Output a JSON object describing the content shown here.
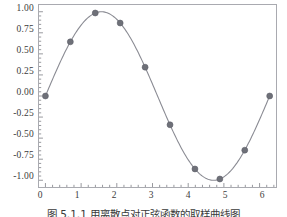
{
  "figure": {
    "caption": "图 5.1.1 用离散点对正弦函数的取样曲线图"
  },
  "axes": {
    "y_ticks": [
      "1.00",
      "0.75",
      "0.50",
      "0.25",
      "0.00",
      "-0.25",
      "-0.50",
      "-0.75",
      "-1.00"
    ],
    "x_ticks": [
      "0",
      "1",
      "2",
      "3",
      "4",
      "5",
      "6"
    ],
    "frame_color": "#a9aab0",
    "tick_color": "#8b8c92"
  },
  "style": {
    "line_color": "#8a8b93",
    "marker_color": "#6e7078",
    "marker_edge_color": "#5d5f68",
    "background": "#ffffff"
  },
  "chart_data": {
    "type": "line",
    "title": "",
    "xlabel": "",
    "ylabel": "",
    "xlim": [
      -0.18,
      6.46
    ],
    "ylim": [
      -1.08,
      1.08
    ],
    "grid": false,
    "legend": null,
    "markers": true,
    "series": [
      {
        "name": "sin(x) sampled",
        "x": [
          0.0,
          0.698,
          1.396,
          2.094,
          2.793,
          3.491,
          4.189,
          4.887,
          5.585,
          6.283
        ],
        "y": [
          0.0,
          0.643,
          0.985,
          0.866,
          0.342,
          -0.342,
          -0.866,
          -0.985,
          -0.643,
          0.0
        ]
      },
      {
        "name": "sin(x) continuous",
        "x_range": [
          0,
          6.283
        ],
        "function": "sin(x)",
        "samples": 200
      }
    ]
  }
}
